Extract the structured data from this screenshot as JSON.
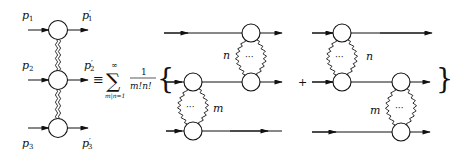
{
  "left_diagram": {
    "labels": {
      "p1": "p",
      "p1_sub": "1",
      "p1p": "p",
      "p1p_sub": "1",
      "p2": "p",
      "p2_sub": "2",
      "p2p": "p",
      "p2p_sub": "2",
      "p3": "p",
      "p3_sub": "3",
      "p3p": "p",
      "p3p_sub": "3",
      "prime": "′"
    }
  },
  "equation": {
    "equiv": "≡",
    "sum": "∑",
    "sum_upper": "∞",
    "sum_lower": "m|n=1",
    "frac_num": "1",
    "frac_den": "m!n!",
    "open_brace": "{",
    "close_brace": "}",
    "plus": "+"
  },
  "diagram_a": {
    "label_n": "n",
    "label_m": "m",
    "dots": "···"
  },
  "diagram_b": {
    "label_n": "n",
    "label_m": "m",
    "dots": "···"
  }
}
